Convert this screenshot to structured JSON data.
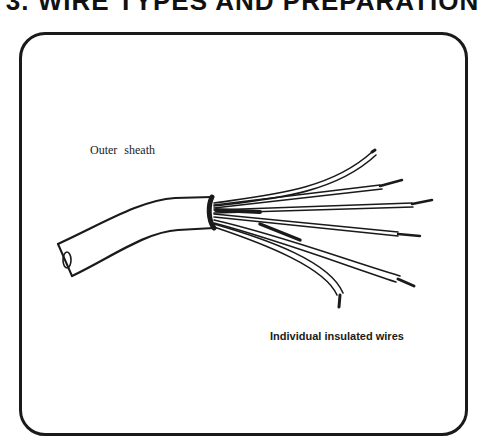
{
  "page": {
    "title": "3. WIRE TYPES AND PREPARATION"
  },
  "diagram": {
    "labels": {
      "outer_sheath": "Outer sheath",
      "individual_wires": "Individual insulated wires"
    },
    "colors": {
      "ink": "#1a1a1a",
      "background": "#ffffff"
    }
  }
}
